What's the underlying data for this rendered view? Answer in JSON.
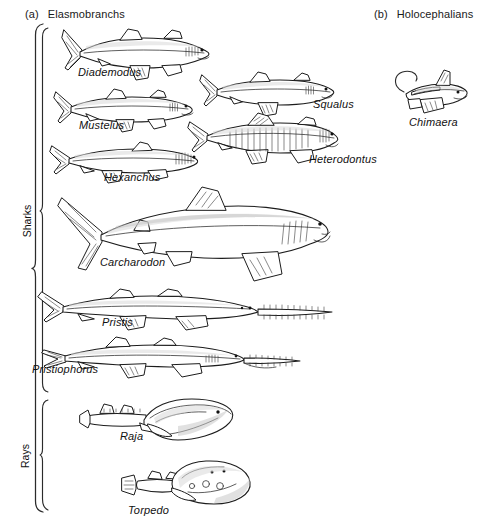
{
  "figure": {
    "background_color": "#ffffff",
    "ink_color": "#1c1c1c",
    "width": 487,
    "height": 526
  },
  "panels": [
    {
      "tag": "(a)",
      "title": "Elasmobranchs"
    },
    {
      "tag": "(b)",
      "title": "Holocephalians"
    }
  ],
  "groups": [
    {
      "label": "Sharks"
    },
    {
      "label": "Rays"
    }
  ],
  "taxa": [
    {
      "name": "Diademodus"
    },
    {
      "name": "Mustelus"
    },
    {
      "name": "Squalus"
    },
    {
      "name": "Hexanchus"
    },
    {
      "name": "Heterodontus"
    },
    {
      "name": "Carcharodon"
    },
    {
      "name": "Pristis"
    },
    {
      "name": "Pristiophorus"
    },
    {
      "name": "Raja"
    },
    {
      "name": "Torpedo"
    },
    {
      "name": "Chimaera"
    }
  ]
}
